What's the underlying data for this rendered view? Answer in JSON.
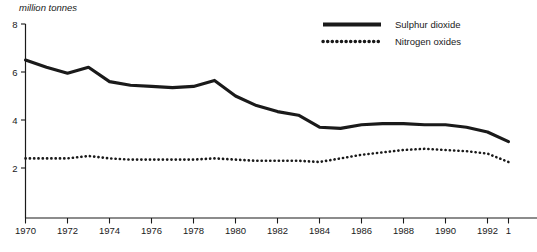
{
  "chart_data": {
    "type": "line",
    "title": "",
    "subtitle": "",
    "xlabel": "",
    "ylabel": "million tonnes",
    "ylim": [
      0,
      8
    ],
    "xlim": [
      1970,
      1993
    ],
    "grid": false,
    "legend_position": "top-right",
    "y_ticks": [
      "8",
      "6",
      "4",
      "2"
    ],
    "y_tick_values": [
      8,
      6,
      4,
      2
    ],
    "x_ticks": [
      "1970",
      "1972",
      "1974",
      "1976",
      "1978",
      "1980",
      "1982",
      "1984",
      "1986",
      "1988",
      "1990",
      "1992",
      "1"
    ],
    "x_tick_values": [
      1970,
      1972,
      1974,
      1976,
      1978,
      1980,
      1982,
      1984,
      1986,
      1988,
      1990,
      1992,
      1993
    ],
    "x": [
      1970,
      1971,
      1972,
      1973,
      1974,
      1975,
      1976,
      1977,
      1978,
      1979,
      1980,
      1981,
      1982,
      1983,
      1984,
      1985,
      1986,
      1987,
      1988,
      1989,
      1990,
      1991,
      1992,
      1993
    ],
    "series": [
      {
        "name": "Sulphur dioxide",
        "style": "solid",
        "color": "#1a1a1a",
        "values": [
          6.5,
          6.2,
          5.95,
          6.2,
          5.6,
          5.45,
          5.4,
          5.35,
          5.4,
          5.65,
          5.0,
          4.6,
          4.35,
          4.2,
          3.7,
          3.65,
          3.8,
          3.85,
          3.85,
          3.8,
          3.8,
          3.7,
          3.5,
          3.1
        ]
      },
      {
        "name": "Nitrogen oxides",
        "style": "dotted",
        "color": "#1a1a1a",
        "values": [
          2.4,
          2.4,
          2.4,
          2.5,
          2.4,
          2.35,
          2.35,
          2.35,
          2.35,
          2.4,
          2.35,
          2.3,
          2.3,
          2.3,
          2.25,
          2.4,
          2.55,
          2.65,
          2.75,
          2.8,
          2.75,
          2.7,
          2.6,
          2.25
        ]
      }
    ]
  }
}
